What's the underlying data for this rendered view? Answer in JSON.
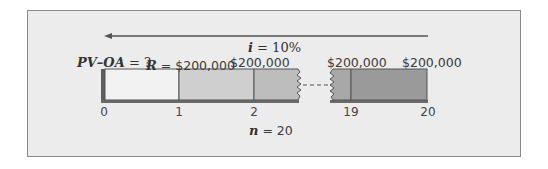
{
  "diagram": {
    "type": "annuity-timeline",
    "interest_label": {
      "var": "i",
      "text": " = 10%"
    },
    "periods_label": {
      "var": "n",
      "text": " = 20"
    },
    "pv_label": {
      "var": "PV–OA",
      "text": " = ?"
    },
    "rent_label": {
      "var": "R",
      "text": " = $200,000"
    },
    "payments": [
      {
        "period": 2,
        "label": "$200,000"
      },
      {
        "period": 19,
        "label": "$200,000"
      },
      {
        "period": 20,
        "label": "$200,000"
      }
    ],
    "ticks": [
      "0",
      "1",
      "2",
      "19",
      "20"
    ],
    "arrow_direction": "left",
    "colors": {
      "panel_bg": "#ececec",
      "panel_border": "#8a8a8a",
      "segment_0_1": "#f2f2f2",
      "segment_1_2": "#cfcfcf",
      "segment_2_break": "#bdbdbd",
      "segment_break_19": "#a8a8a8",
      "segment_19_20": "#9a9a9a",
      "shadow": "#5e5e5e"
    }
  }
}
